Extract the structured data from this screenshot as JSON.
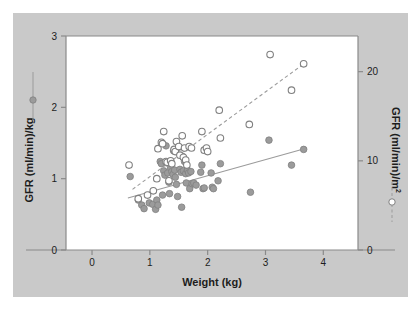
{
  "figure": {
    "background_color": "#ffffff",
    "panel_color": "#c9c9c9",
    "plot_color": "#ffffff",
    "frame_color": "#8a8a8a",
    "marker_color": "#9b9b9b",
    "marker_edge_color": "#808080",
    "line_color": "#9b9b9b"
  },
  "chart_data": {
    "type": "scatter",
    "title": "",
    "xlabel": "Weight (kg)",
    "ylabel": "GFR (ml/min)/kg",
    "y2label_main": "GFR (ml/min)/m",
    "y2label_sup": "2",
    "xlim": [
      -0.45,
      4.6
    ],
    "ylim": [
      0,
      3
    ],
    "y2lim": [
      0,
      24
    ],
    "xticks": [
      0,
      1,
      2,
      3,
      4
    ],
    "xticklabels": [
      "0",
      "1",
      "2",
      "3",
      "4"
    ],
    "yticks": [
      0,
      1,
      2,
      3
    ],
    "yticklabels": [
      "0",
      "1",
      "2",
      "3"
    ],
    "y2ticks": [
      0,
      10,
      20
    ],
    "y2ticklabels": [
      "0",
      "10",
      "20"
    ],
    "grid": false,
    "legend_position": "axis-labels",
    "series": [
      {
        "name": "GFR (ml/min)/kg",
        "marker": "filled-circle",
        "axis": "left",
        "trendline": "solid",
        "trendline_points": [
          [
            0.62,
            0.73
          ],
          [
            3.72,
            1.43
          ]
        ],
        "points": [
          [
            0.66,
            1.03
          ],
          [
            0.8,
            0.7
          ],
          [
            0.86,
            0.63
          ],
          [
            0.9,
            0.58
          ],
          [
            0.99,
            0.66
          ],
          [
            1.05,
            0.64
          ],
          [
            1.1,
            0.57
          ],
          [
            1.12,
            0.7
          ],
          [
            1.14,
            0.63
          ],
          [
            1.18,
            1.24
          ],
          [
            1.2,
            1.21
          ],
          [
            1.22,
            0.77
          ],
          [
            1.24,
            1.11
          ],
          [
            1.26,
            1.05
          ],
          [
            1.28,
            1.46
          ],
          [
            1.3,
            1.22
          ],
          [
            1.31,
            1.08
          ],
          [
            1.33,
            0.95
          ],
          [
            1.34,
            0.79
          ],
          [
            1.36,
            1.15
          ],
          [
            1.38,
            1.1
          ],
          [
            1.4,
            1.06
          ],
          [
            1.41,
            1.39
          ],
          [
            1.43,
            1.12
          ],
          [
            1.44,
            1.02
          ],
          [
            1.46,
            0.92
          ],
          [
            1.48,
            0.75
          ],
          [
            1.5,
            1.44
          ],
          [
            1.52,
            1.13
          ],
          [
            1.54,
            1.09
          ],
          [
            1.55,
            0.6
          ],
          [
            1.57,
            1.31
          ],
          [
            1.58,
            1.11
          ],
          [
            1.6,
            1.24
          ],
          [
            1.62,
            1.07
          ],
          [
            1.63,
            0.94
          ],
          [
            1.65,
            1.12
          ],
          [
            1.67,
            1.08
          ],
          [
            1.69,
            0.86
          ],
          [
            1.71,
            1.1
          ],
          [
            1.73,
            0.93
          ],
          [
            1.76,
            0.94
          ],
          [
            1.8,
            0.91
          ],
          [
            1.88,
            1.09
          ],
          [
            1.9,
            1.19
          ],
          [
            1.92,
            0.86
          ],
          [
            1.94,
            0.87
          ],
          [
            2.06,
            1.08
          ],
          [
            2.08,
            0.88
          ],
          [
            2.1,
            0.86
          ],
          [
            2.18,
            0.97
          ],
          [
            2.22,
            1.21
          ],
          [
            2.74,
            0.81
          ],
          [
            3.06,
            1.54
          ],
          [
            3.45,
            1.19
          ],
          [
            3.66,
            1.41
          ]
        ]
      },
      {
        "name": "GFR (ml/min)/m2",
        "marker": "open-circle",
        "axis": "right",
        "trendline": "dashed",
        "trendline_points": [
          [
            0.7,
            0.85
          ],
          [
            3.68,
            2.62
          ]
        ],
        "points": [
          [
            0.64,
            1.19
          ],
          [
            0.8,
            0.72
          ],
          [
            0.96,
            0.77
          ],
          [
            1.06,
            0.83
          ],
          [
            1.12,
            1.0
          ],
          [
            1.14,
            1.42
          ],
          [
            1.2,
            1.51
          ],
          [
            1.22,
            1.49
          ],
          [
            1.24,
            1.66
          ],
          [
            1.28,
            1.24
          ],
          [
            1.3,
            1.23
          ],
          [
            1.33,
            0.97
          ],
          [
            1.36,
            1.25
          ],
          [
            1.38,
            1.21
          ],
          [
            1.42,
            1.41
          ],
          [
            1.44,
            1.38
          ],
          [
            1.46,
            1.52
          ],
          [
            1.5,
            1.45
          ],
          [
            1.52,
            1.33
          ],
          [
            1.56,
            1.6
          ],
          [
            1.58,
            1.3
          ],
          [
            1.6,
            1.43
          ],
          [
            1.62,
            1.26
          ],
          [
            1.64,
            1.19
          ],
          [
            1.68,
            1.45
          ],
          [
            1.72,
            1.43
          ],
          [
            1.9,
            1.66
          ],
          [
            1.94,
            1.4
          ],
          [
            1.98,
            1.43
          ],
          [
            2.0,
            1.38
          ],
          [
            2.2,
            1.96
          ],
          [
            2.22,
            1.57
          ],
          [
            2.72,
            1.76
          ],
          [
            3.08,
            2.74
          ],
          [
            3.45,
            2.24
          ],
          [
            3.66,
            2.61
          ]
        ]
      }
    ]
  }
}
